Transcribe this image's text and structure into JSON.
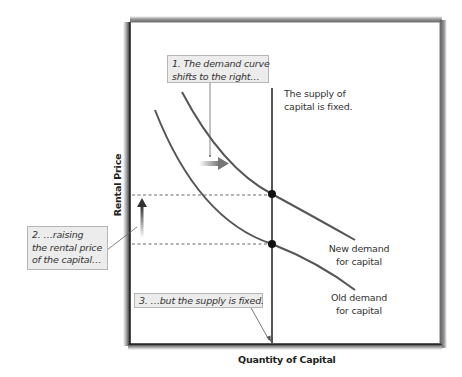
{
  "diagram": {
    "axes": {
      "x_label": "Quantity of Capital",
      "y_label": "Rental Price"
    },
    "callouts": {
      "step1_line1": "1. The demand curve",
      "step1_line2": "shifts to the right…",
      "step2_line1": "2. …raising",
      "step2_line2": "the rental price",
      "step2_line3": "of the capital…",
      "step3": "3. …but the supply is fixed."
    },
    "labels": {
      "supply_line1": "The supply of",
      "supply_line2": "capital is fixed.",
      "new_demand_line1": "New demand",
      "new_demand_line2": "for capital",
      "old_demand_line1": "Old demand",
      "old_demand_line2": "for capital"
    },
    "colors": {
      "curve": "#555555",
      "axis": "#222222",
      "callout_bg": "#ececec",
      "callout_border": "#b5b5b5",
      "point": "#111111"
    },
    "elements": {
      "supply_curve": "vertical line (fixed supply)",
      "old_demand_curve": "downward-sloping curve",
      "new_demand_curve": "downward-sloping curve shifted right",
      "equilibrium_points": [
        "new equilibrium (higher rental price)",
        "old equilibrium (lower rental price)"
      ],
      "shift_arrow": "right-arrow-icon",
      "price_rise_arrow": "up-arrow-icon"
    }
  }
}
